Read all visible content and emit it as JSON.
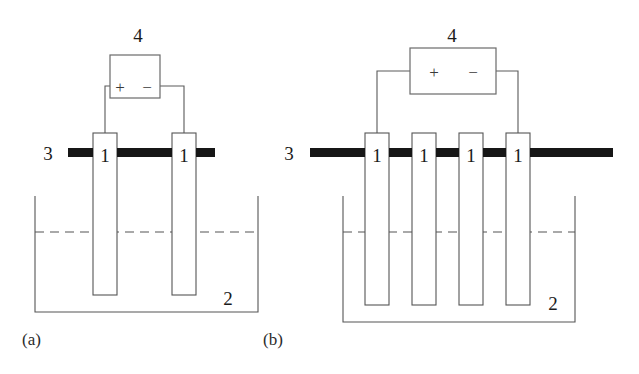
{
  "figure": {
    "width": 639,
    "height": 374,
    "background": "#ffffff",
    "ink_color": "#555555",
    "busbar_color": "#161616"
  },
  "legend": {
    "electrode": "1",
    "tank": "2",
    "busbar": "3",
    "power_supply": "4",
    "plus": "+",
    "minus": "−"
  },
  "panels": [
    {
      "id": "a",
      "caption": "(a)",
      "caption_x": 22,
      "caption_y": 345,
      "electrode_count": 2,
      "labels": {
        "busbar": "3",
        "busbar_x": 48,
        "busbar_y": 160,
        "tank": "2",
        "tank_x": 228,
        "tank_y": 305,
        "supply": "4",
        "supply_x": 138,
        "supply_y": 42,
        "plus": "+",
        "plus_x": 120,
        "plus_y": 93,
        "minus": "−",
        "minus_x": 147,
        "minus_y": 93
      },
      "supply_box": {
        "x": 110,
        "y": 55,
        "w": 50,
        "h": 43
      },
      "busbar": {
        "x": 68,
        "y": 148,
        "w": 147,
        "h": 9
      },
      "tank": {
        "left": 35,
        "right": 258,
        "top": 196,
        "bottom": 312
      },
      "liquid_level": {
        "x1": 35,
        "x2": 258,
        "y": 232
      },
      "electrodes": [
        {
          "x": 93,
          "y": 133,
          "w": 24,
          "h": 162,
          "label": "1",
          "label_x": 105,
          "label_y": 162
        },
        {
          "x": 172,
          "y": 133,
          "w": 24,
          "h": 162,
          "label": "1",
          "label_x": 184,
          "label_y": 162
        }
      ],
      "wires": [
        "M110,86 L105,86 L105,133",
        "M160,86 L184,86 L184,133"
      ]
    },
    {
      "id": "b",
      "caption": "(b)",
      "caption_x": 263,
      "caption_y": 345,
      "electrode_count": 4,
      "labels": {
        "busbar": "3",
        "busbar_x": 289,
        "busbar_y": 160,
        "tank": "2",
        "tank_x": 553,
        "tank_y": 310,
        "supply": "4",
        "supply_x": 452,
        "supply_y": 42,
        "plus": "+",
        "plus_x": 434,
        "plus_y": 78,
        "minus": "−",
        "minus_x": 473,
        "minus_y": 78
      },
      "supply_box": {
        "x": 410,
        "y": 48,
        "w": 86,
        "h": 46
      },
      "busbar": {
        "x": 310,
        "y": 148,
        "w": 303,
        "h": 9
      },
      "tank": {
        "left": 343,
        "right": 575,
        "top": 196,
        "bottom": 322
      },
      "liquid_level": {
        "x1": 343,
        "x2": 575,
        "y": 232
      },
      "electrodes": [
        {
          "x": 365,
          "y": 133,
          "w": 24,
          "h": 172,
          "label": "1",
          "label_x": 377,
          "label_y": 162
        },
        {
          "x": 412,
          "y": 133,
          "w": 24,
          "h": 172,
          "label": "1",
          "label_x": 424,
          "label_y": 162
        },
        {
          "x": 459,
          "y": 133,
          "w": 24,
          "h": 172,
          "label": "1",
          "label_x": 471,
          "label_y": 162
        },
        {
          "x": 506,
          "y": 133,
          "w": 24,
          "h": 172,
          "label": "1",
          "label_x": 518,
          "label_y": 162
        }
      ],
      "wires": [
        "M410,71 L377,71 L377,133",
        "M496,71 L518,71 L518,133"
      ]
    }
  ]
}
